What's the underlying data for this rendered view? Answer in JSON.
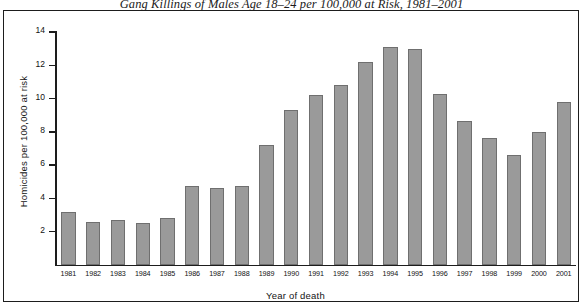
{
  "chart_data": {
    "type": "bar",
    "title": "Gang Killings of Males Age 18–24 per 100,000 at Risk, 1981–2001",
    "xlabel": "Year of death",
    "ylabel": "Homicides per 100,000 at risk",
    "categories": [
      "1981",
      "1982",
      "1983",
      "1984",
      "1985",
      "1986",
      "1987",
      "1988",
      "1989",
      "1990",
      "1991",
      "1992",
      "1993",
      "1994",
      "1995",
      "1996",
      "1997",
      "1998",
      "1999",
      "2000",
      "2001"
    ],
    "values": [
      3.2,
      2.6,
      2.7,
      2.5,
      2.8,
      4.75,
      4.6,
      4.75,
      7.2,
      9.3,
      10.2,
      10.8,
      12.2,
      13.1,
      13.0,
      10.3,
      8.65,
      7.65,
      6.6,
      8.0,
      9.8
    ],
    "ylim": [
      0,
      14
    ],
    "yticks": [
      2,
      4,
      6,
      8,
      10,
      12,
      14
    ],
    "ytick_labels": [
      "2",
      "4",
      "6",
      "8",
      "10",
      "12",
      "14"
    ],
    "grid": false,
    "legend": "none",
    "bar_color": "#9a9a9a",
    "bar_edge_color": "#6f6f6f",
    "axis_color": "#1d1d1d"
  }
}
